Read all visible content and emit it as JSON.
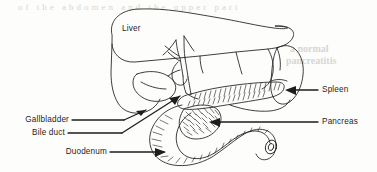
{
  "figure": {
    "background_color": "#fdfdfc",
    "ink_color": "#1d1d1d",
    "ghost_color": "#d9d6d2",
    "width": 377,
    "height": 172
  },
  "labels": {
    "liver": "Liver",
    "gallbladder": "Gallbladder",
    "bile_duct": "Bile duct",
    "duodenum": "Duodenum",
    "spleen": "Spleen",
    "pancreas": "Pancreas"
  },
  "ghost_artifacts": {
    "top_band": "of the abdomen and the upper part",
    "right_upper": "a normal",
    "right_lower": "pancreatitis"
  }
}
